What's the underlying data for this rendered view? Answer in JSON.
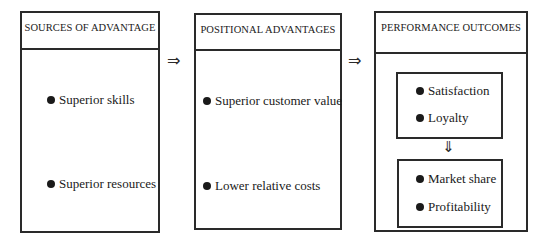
{
  "diagram": {
    "boxes": [
      {
        "title": "SOURCES OF ADVANTAGE",
        "items": [
          "Superior skills",
          "Superior resources"
        ]
      },
      {
        "title": "POSITIONAL ADVANTAGES",
        "items": [
          "Superior customer value",
          "Lower relative costs"
        ]
      },
      {
        "title": "PERFORMANCE OUTCOMES",
        "groups": [
          {
            "items": [
              "Satisfaction",
              "Loyalty"
            ]
          },
          {
            "items": [
              "Market share",
              "Profitability"
            ]
          }
        ]
      }
    ],
    "arrows": {
      "right_1": "⇒",
      "right_2": "⇒",
      "down": "⇓"
    },
    "bullet_icon": "filled-circle",
    "line_color": "#2a2a2a"
  }
}
